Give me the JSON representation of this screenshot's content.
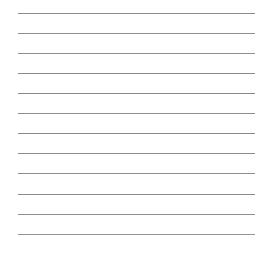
{
  "canvas": {
    "width": 266,
    "height": 253,
    "background_color": "#ffffff"
  },
  "ruled_sheet": {
    "kind": "ruled-lined-paper",
    "line_count": 12,
    "line_color": "#8c8c8c",
    "line_thickness_px": 1,
    "line_start_x_px": 18,
    "line_end_x_px": 255,
    "line_length_px": 237,
    "first_line_y_px": 13,
    "line_spacing_px": 20.1,
    "left_margin_px": 18,
    "right_margin_px": 11,
    "top_margin_px": 13,
    "bottom_margin_px": 19,
    "lines": [
      {
        "index": 1,
        "y": 13,
        "x1": 18,
        "x2": 255,
        "color": "#8c8c8c"
      },
      {
        "index": 2,
        "y": 33,
        "x1": 18,
        "x2": 255,
        "color": "#8f8f8f"
      },
      {
        "index": 3,
        "y": 53,
        "x1": 18,
        "x2": 255,
        "color": "#909090"
      },
      {
        "index": 4,
        "y": 73,
        "x1": 18,
        "x2": 255,
        "color": "#8b8b8b"
      },
      {
        "index": 5,
        "y": 93,
        "x1": 18,
        "x2": 255,
        "color": "#898989"
      },
      {
        "index": 6,
        "y": 113,
        "x1": 18,
        "x2": 255,
        "color": "#8d8d8d"
      },
      {
        "index": 7,
        "y": 133,
        "x1": 18,
        "x2": 255,
        "color": "#8a8a8a"
      },
      {
        "index": 8,
        "y": 153,
        "x1": 18,
        "x2": 255,
        "color": "#8c8c8c"
      },
      {
        "index": 9,
        "y": 173,
        "x1": 18,
        "x2": 255,
        "color": "#8e8e8e"
      },
      {
        "index": 10,
        "y": 194,
        "x1": 18,
        "x2": 255,
        "color": "#8b8b8b"
      },
      {
        "index": 11,
        "y": 214,
        "x1": 18,
        "x2": 255,
        "color": "#909090"
      },
      {
        "index": 12,
        "y": 234,
        "x1": 18,
        "x2": 255,
        "color": "#949494"
      }
    ]
  }
}
